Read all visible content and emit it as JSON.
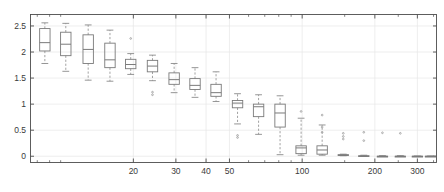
{
  "figure": {
    "background": "#ffffff",
    "axis_color": "#4d4d4d",
    "grid_color": "#e6e6e6",
    "box_color": "#7a7a7a",
    "median_color": "#7a7a7a",
    "whisker_color": "#8a8a8a",
    "outlier_color": "#9a9a9a"
  },
  "chart_data": {
    "type": "box",
    "title": "",
    "xlabel": "",
    "ylabel": "",
    "xscale": "log",
    "yscale": "linear",
    "xlim": [
      7.5,
      360
    ],
    "ylim": [
      -0.12,
      2.72
    ],
    "grid": true,
    "legend": null,
    "xtick_labels": [
      "20",
      "30",
      "40",
      "50",
      "100",
      "200",
      "300"
    ],
    "xtick_values": [
      20,
      30,
      40,
      50,
      100,
      200,
      300
    ],
    "xminor_ticks": [
      8,
      9,
      10,
      60,
      70,
      80,
      90,
      150,
      250,
      350
    ],
    "ytick_labels": [
      "0",
      "0.5",
      "1",
      "1.5",
      "2",
      "2.5"
    ],
    "ytick_values": [
      0,
      0.5,
      1,
      1.5,
      2,
      2.5
    ],
    "boxes": [
      {
        "x": 8.6,
        "whisker_low": 1.78,
        "q1": 2.02,
        "median": 2.18,
        "q3": 2.45,
        "whisker_high": 2.56,
        "outliers": []
      },
      {
        "x": 10.5,
        "whisker_low": 1.63,
        "q1": 1.93,
        "median": 2.15,
        "q3": 2.38,
        "whisker_high": 2.55,
        "outliers": []
      },
      {
        "x": 13.0,
        "whisker_low": 1.46,
        "q1": 1.78,
        "median": 2.05,
        "q3": 2.33,
        "whisker_high": 2.52,
        "outliers": []
      },
      {
        "x": 16.0,
        "whisker_low": 1.44,
        "q1": 1.7,
        "median": 1.85,
        "q3": 2.17,
        "whisker_high": 2.42,
        "outliers": []
      },
      {
        "x": 19.5,
        "whisker_low": 1.57,
        "q1": 1.68,
        "median": 1.76,
        "q3": 1.86,
        "whisker_high": 1.97,
        "outliers": [
          2.26
        ]
      },
      {
        "x": 24.0,
        "whisker_low": 1.45,
        "q1": 1.62,
        "median": 1.73,
        "q3": 1.84,
        "whisker_high": 1.94,
        "outliers": [
          1.23,
          1.18
        ]
      },
      {
        "x": 29.5,
        "whisker_low": 1.22,
        "q1": 1.38,
        "median": 1.47,
        "q3": 1.6,
        "whisker_high": 1.78,
        "outliers": []
      },
      {
        "x": 36.0,
        "whisker_low": 1.13,
        "q1": 1.28,
        "median": 1.36,
        "q3": 1.49,
        "whisker_high": 1.7,
        "outliers": []
      },
      {
        "x": 44.0,
        "whisker_low": 1.05,
        "q1": 1.15,
        "median": 1.22,
        "q3": 1.38,
        "whisker_high": 1.62,
        "outliers": []
      },
      {
        "x": 54.0,
        "whisker_low": 0.62,
        "q1": 0.93,
        "median": 1.02,
        "q3": 1.07,
        "whisker_high": 1.2,
        "outliers": [
          0.4,
          0.36
        ]
      },
      {
        "x": 66.0,
        "whisker_low": 0.42,
        "q1": 0.76,
        "median": 0.95,
        "q3": 1.0,
        "whisker_high": 1.18,
        "outliers": []
      },
      {
        "x": 81.0,
        "whisker_low": 0.03,
        "q1": 0.56,
        "median": 0.83,
        "q3": 1.0,
        "whisker_high": 1.16,
        "outliers": []
      },
      {
        "x": 99.0,
        "whisker_low": 0.02,
        "q1": 0.05,
        "median": 0.16,
        "q3": 0.2,
        "whisker_high": 0.73,
        "outliers": [
          0.86
        ]
      },
      {
        "x": 121.0,
        "whisker_low": 0.02,
        "q1": 0.04,
        "median": 0.12,
        "q3": 0.2,
        "whisker_high": 0.6,
        "outliers": [
          0.79,
          0.56,
          0.46
        ]
      },
      {
        "x": 148.0,
        "whisker_low": 0.01,
        "q1": 0.02,
        "median": 0.02,
        "q3": 0.03,
        "whisker_high": 0.04,
        "outliers": [
          0.44,
          0.38,
          0.33
        ]
      },
      {
        "x": 180.0,
        "whisker_low": 0.0,
        "q1": 0.0,
        "median": 0.0,
        "q3": 0.01,
        "whisker_high": 0.02,
        "outliers": [
          0.46,
          0.3
        ]
      },
      {
        "x": 215.0,
        "whisker_low": 0.0,
        "q1": 0.0,
        "median": 0.0,
        "q3": 0.0,
        "whisker_high": 0.01,
        "outliers": [
          0.45
        ]
      },
      {
        "x": 255.0,
        "whisker_low": 0.0,
        "q1": 0.0,
        "median": 0.0,
        "q3": 0.0,
        "whisker_high": 0.01,
        "outliers": [
          0.44
        ]
      },
      {
        "x": 300.0,
        "whisker_low": 0.0,
        "q1": 0.0,
        "median": 0.0,
        "q3": 0.0,
        "whisker_high": 0.0,
        "outliers": []
      },
      {
        "x": 340.0,
        "whisker_low": 0.0,
        "q1": 0.0,
        "median": 0.0,
        "q3": 0.0,
        "whisker_high": 0.0,
        "outliers": []
      }
    ]
  }
}
